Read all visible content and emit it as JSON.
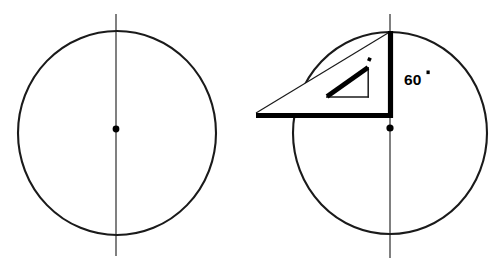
{
  "figure": {
    "background_color": "#ffffff",
    "stroke_color": "#1a1a1a",
    "accent_color": "#000000",
    "width": 502,
    "height": 273,
    "panels": [
      {
        "id": "left-panel",
        "name": "plain-circle-with-vertical-axis",
        "circle": {
          "center_x": 117,
          "center_y": 133,
          "radius_x": 99,
          "radius_y": 102
        },
        "center_dot": {
          "x": 116,
          "y": 129,
          "radius": 3.4
        },
        "axis": {
          "x": 116,
          "y_top": 14,
          "y_bottom": 256
        },
        "labels": []
      },
      {
        "id": "right-panel",
        "name": "circle-with-set-square-and-angle",
        "circle": {
          "center_x": 390,
          "center_y": 133,
          "radius_x": 97,
          "radius_y": 101
        },
        "center_dot": {
          "x": 390,
          "y": 128,
          "radius": 3.6
        },
        "axis": {
          "x": 390,
          "y_top": 14,
          "y_bottom": 258
        },
        "set_square": {
          "name": "30-60-90-set-square",
          "apex_x": 256,
          "apex_y": 113,
          "top_vertex_x": 390,
          "top_vertex_y": 32,
          "corner_x": 390,
          "corner_y": 116,
          "inner_triangle": {
            "left_x": 327,
            "left_y": 97,
            "top_x": 368,
            "top_y": 68,
            "right_x": 368,
            "right_y": 97
          },
          "right_angle_tick": {
            "x": 369,
            "y": 59,
            "size": 3.2
          }
        },
        "labels": [
          {
            "id": "angle-60",
            "text": "60",
            "degree_symbol": true,
            "x": 405,
            "y": 79
          }
        ]
      }
    ]
  }
}
